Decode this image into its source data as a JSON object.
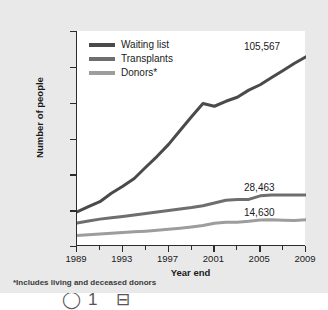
{
  "chart_data": {
    "type": "line",
    "title": "",
    "xlabel": "Year end",
    "ylabel": "Number of people",
    "xlim": [
      1989,
      2009
    ],
    "ylim": [
      0,
      120000
    ],
    "ytick_labels": [
      "120,000",
      "100,000",
      "80,000",
      "60,000",
      "40,000",
      "20,000",
      "0"
    ],
    "ytick_values": [
      120000,
      100000,
      80000,
      60000,
      40000,
      20000,
      0
    ],
    "xtick_labels": [
      "1989",
      "1993",
      "1997",
      "2001",
      "2005",
      "2009"
    ],
    "xtick_values": [
      1989,
      1993,
      1997,
      2001,
      2005,
      2009
    ],
    "xtick_minor_values": [
      1991,
      1995,
      1999,
      2003,
      2007
    ],
    "grid": false,
    "legend_position": "upper left",
    "x": [
      1989,
      1990,
      1991,
      1992,
      1993,
      1994,
      1995,
      1996,
      1997,
      1998,
      1999,
      2000,
      2001,
      2002,
      2003,
      2004,
      2005,
      2006,
      2007,
      2008,
      2009
    ],
    "series": [
      {
        "name": "Waiting list",
        "color": "#4a4a4a",
        "end_label": "105,567",
        "values": [
          19095,
          21914,
          24719,
          29415,
          33394,
          37681,
          43937,
          50046,
          56716,
          64423,
          72110,
          79523,
          78000,
          80786,
          83000,
          87000,
          90000,
          94000,
          98000,
          102000,
          105567
        ]
      },
      {
        "name": "Transplants",
        "color": "#6e6e6e",
        "end_label": "28,463",
        "values": [
          12840,
          14000,
          15000,
          15750,
          16500,
          17300,
          18100,
          19000,
          19800,
          20700,
          21500,
          22500,
          24000,
          25500,
          26000,
          26000,
          28000,
          28500,
          28500,
          28400,
          28463
        ]
      },
      {
        "name": "Donors*",
        "color": "#9d9d9d",
        "end_label": "14,630",
        "values": [
          5900,
          6300,
          6700,
          7100,
          7500,
          7900,
          8300,
          8800,
          9300,
          9900,
          10600,
          11400,
          12700,
          13300,
          13300,
          13800,
          14500,
          14700,
          14400,
          14200,
          14630
        ]
      }
    ]
  },
  "legend": {
    "items": [
      {
        "label": "Waiting list",
        "color": "#4a4a4a"
      },
      {
        "label": "Transplants",
        "color": "#6e6e6e"
      },
      {
        "label": "Donors*",
        "color": "#9d9d9d"
      }
    ]
  },
  "footnote": "*Includes living and deceased donors",
  "bottom_strip": {
    "glyphs": "◯1  ⊟"
  }
}
